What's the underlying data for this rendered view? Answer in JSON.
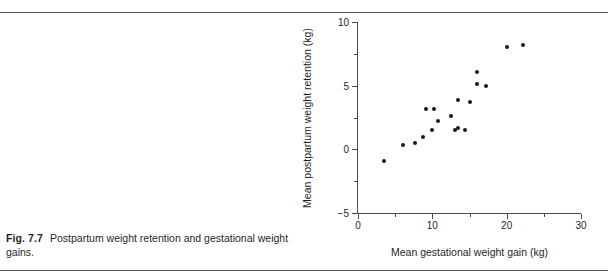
{
  "caption": {
    "figure_number": "Fig. 7.7",
    "text": "Postpartum weight retention and gestational weight gains."
  },
  "chart_data": {
    "type": "scatter",
    "title": "",
    "xlabel": "Mean gestational weight gain (kg)",
    "ylabel": "Mean postpartum weight retention (kg)",
    "xlim": [
      0,
      30
    ],
    "ylim": [
      -5,
      10
    ],
    "xticks": [
      0,
      10,
      20,
      30
    ],
    "xticks_labels": [
      "0",
      "10",
      "20",
      "30"
    ],
    "xticks_minor": [
      5,
      15,
      25
    ],
    "yticks": [
      -5,
      0,
      5,
      10
    ],
    "yticks_labels": [
      "−5",
      "0",
      "5",
      "10"
    ],
    "yticks_minor": [
      -2.5,
      2.5,
      7.5
    ],
    "grid": false,
    "legend": null,
    "marker": "filled-circle",
    "marker_color": "#1a1a1a",
    "x": [
      3.5,
      6.0,
      7.7,
      8.7,
      9.2,
      9.9,
      10.2,
      10.8,
      12.5,
      13.0,
      13.4,
      13.4,
      14.4,
      15.0,
      16.0,
      16.0,
      17.2,
      20.0,
      22.2
    ],
    "y": [
      -0.9,
      0.35,
      0.5,
      1.0,
      3.2,
      1.55,
      3.2,
      2.2,
      2.6,
      1.5,
      1.7,
      3.85,
      1.55,
      3.7,
      6.1,
      5.1,
      5.0,
      8.0,
      8.2
    ],
    "n_points": 19
  }
}
